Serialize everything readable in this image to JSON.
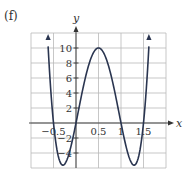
{
  "panel_label": "(f)",
  "chart_data": {
    "type": "line",
    "title": "",
    "xlabel": "x",
    "ylabel": "y",
    "xlim": [
      -1,
      2
    ],
    "ylim": [
      -6,
      12
    ],
    "grid": true,
    "x_grid_step": 0.5,
    "y_grid_step": 2,
    "x_tick_labels": [
      {
        "value": -0.5,
        "label": "-0.5"
      },
      {
        "value": 0.5,
        "label": "0.5"
      },
      {
        "value": 1,
        "label": "1"
      },
      {
        "value": 1.5,
        "label": "1.5"
      }
    ],
    "y_tick_labels": [
      {
        "value": 10,
        "label": "10"
      },
      {
        "value": 8,
        "label": "8"
      },
      {
        "value": 6,
        "label": "6"
      },
      {
        "value": 4,
        "label": "4"
      },
      {
        "value": 2,
        "label": "2"
      },
      {
        "value": -2,
        "label": "-2"
      },
      {
        "value": -4,
        "label": "-4"
      }
    ],
    "series": [
      {
        "name": "f(x)",
        "description": "Quartic curve symmetric about x=0.5, zeros near x=-0.5, 0, 1, 1.5; max at (0.5, 10); minima near (-0.25, -5.5) and (1.25, -5.5); arrows at both ends going upward",
        "x": [
          -0.62,
          -0.5,
          -0.4,
          -0.3,
          -0.25,
          -0.2,
          -0.1,
          0,
          0.1,
          0.2,
          0.3,
          0.4,
          0.5,
          0.6,
          0.7,
          0.8,
          0.9,
          1,
          1.1,
          1.2,
          1.25,
          1.3,
          1.4,
          1.5,
          1.62
        ],
        "y": [
          11.3,
          0,
          -4.03,
          -5.41,
          -5.47,
          -5.18,
          -3.74,
          0,
          2.62,
          5.38,
          7.86,
          9.45,
          10,
          9.45,
          7.86,
          5.38,
          2.62,
          0,
          -3.74,
          -5.18,
          -5.47,
          -5.41,
          -4.03,
          0,
          11.3
        ],
        "color": "#2a3550"
      }
    ]
  }
}
